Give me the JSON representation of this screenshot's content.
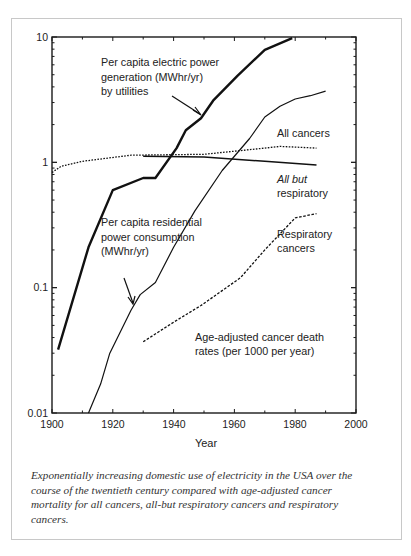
{
  "chart_data": {
    "type": "line",
    "title": "",
    "xlabel": "Year",
    "ylabel": "",
    "yscale": "log",
    "xlim": [
      1900,
      2000
    ],
    "ylim": [
      0.01,
      10
    ],
    "x_ticks": [
      "1900",
      "1920",
      "1940",
      "1960",
      "1980",
      "2000"
    ],
    "y_ticks": [
      "0.01",
      "0.1",
      "1",
      "10"
    ],
    "grid": false,
    "legend": "inline annotations",
    "series": [
      {
        "name": "Per capita electric power generation (MWhr/yr) by utilities",
        "style": "thick solid",
        "x": [
          1902,
          1912,
          1920,
          1930,
          1934,
          1941,
          1944,
          1949,
          1953,
          1961,
          1970,
          1979
        ],
        "y": [
          0.032,
          0.21,
          0.6,
          0.75,
          0.75,
          1.3,
          1.8,
          2.25,
          3.1,
          4.9,
          7.9,
          9.8
        ]
      },
      {
        "name": "Per capita residential power consumption (MWhr/yr)",
        "style": "thin solid",
        "x": [
          1912,
          1916,
          1919,
          1926,
          1929,
          1934,
          1940,
          1947,
          1956,
          1965,
          1970,
          1975,
          1980,
          1985,
          1990
        ],
        "y": [
          0.01,
          0.017,
          0.03,
          0.066,
          0.088,
          0.11,
          0.21,
          0.41,
          0.86,
          1.55,
          2.3,
          2.8,
          3.2,
          3.4,
          3.7
        ]
      },
      {
        "name": "All cancers",
        "style": "dotted",
        "x": [
          1900,
          1903,
          1910,
          1926,
          1950,
          1970,
          1975,
          1987
        ],
        "y": [
          0.83,
          0.93,
          1.02,
          1.14,
          1.16,
          1.3,
          1.34,
          1.3
        ]
      },
      {
        "name": "All but respiratory",
        "style": "solid",
        "x": [
          1930,
          1950,
          1970,
          1987
        ],
        "y": [
          1.12,
          1.1,
          1.02,
          0.95
        ]
      },
      {
        "name": "Respiratory cancers",
        "style": "dashed",
        "x": [
          1930,
          1940,
          1949,
          1962,
          1970,
          1980,
          1987
        ],
        "y": [
          0.037,
          0.053,
          0.072,
          0.12,
          0.2,
          0.36,
          0.39
        ]
      }
    ],
    "annotations": [
      "Per capita electric power generation (MWhr/yr) by utilities",
      "All cancers",
      "All but respiratory",
      "Per capita residential power consumption (MWhr/yr)",
      "Respiratory cancers",
      "Age-adjusted cancer death rates (per 1000 per year)"
    ]
  },
  "labels": {
    "gen_l1": "Per capita electric power",
    "gen_l2": "generation (MWhr/yr)",
    "gen_l3": "by utilities",
    "all_cancers": "All cancers",
    "abr_l1": "All but",
    "abr_l2": "respiratory",
    "res_l1": "Per capita residential",
    "res_l2": "power consumption",
    "res_l3": "(MWhr/yr)",
    "resp_l1": "Respiratory",
    "resp_l2": "cancers",
    "age_l1": "Age-adjusted cancer death",
    "age_l2": "rates (per 1000 per year)",
    "xlabel": "Year",
    "y10": "10",
    "y1": "1",
    "y01": "0.1",
    "y001": "0.01",
    "x1900": "1900",
    "x1920": "1920",
    "x1940": "1940",
    "x1960": "1960",
    "x1980": "1980",
    "x2000": "2000"
  },
  "caption": "Exponentially increasing domestic use of electricity in the USA over the course of the twentieth century compared with age-adjusted cancer mortality for all cancers, all-but respiratory cancers and respiratory cancers."
}
